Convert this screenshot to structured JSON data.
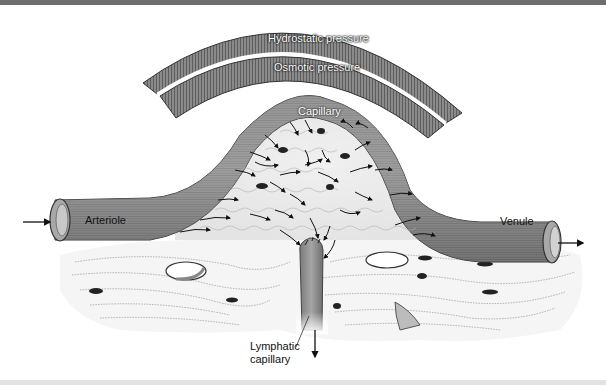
{
  "figure": {
    "labels": {
      "hydrostatic": "Hydrostatic pressure",
      "osmotic": "Osmotic pressure",
      "capillary": "Capillary",
      "arteriole": "Arteriole",
      "venule": "Venule",
      "lymphatic_line1": "Lymphatic",
      "lymphatic_line2": "capillary"
    },
    "flow_arrows": {
      "inflow": "arrow-right",
      "outflow": "arrow-right",
      "lymph_drain": "arrow-down"
    },
    "colors": {
      "pressure_band": "#7a7a7a",
      "vessel": "#8c8c8c",
      "vessel_dark": "#5a5a5a",
      "tissue": "#f2f2f2",
      "cell_nucleus": "#222222",
      "top_bar": "#6e6e6e"
    }
  }
}
